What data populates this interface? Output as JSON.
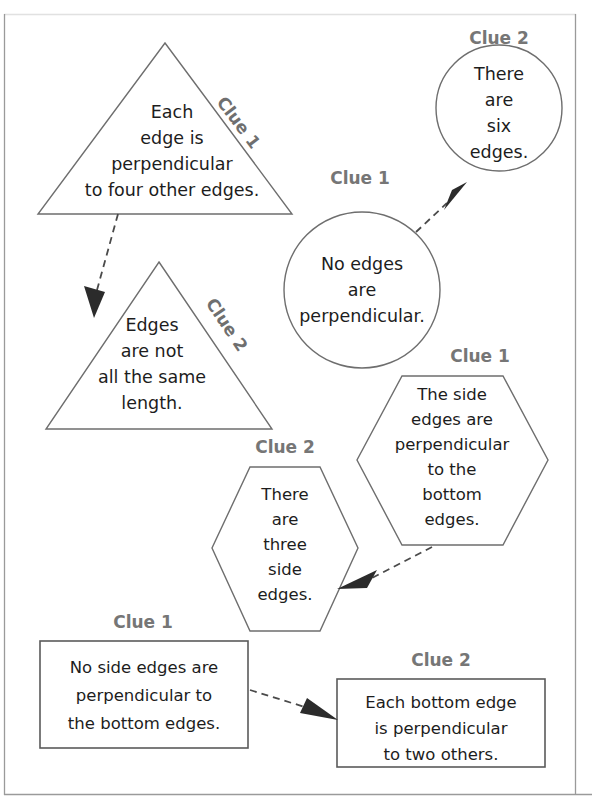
{
  "page": {
    "background_color": "#ffffff",
    "frame_color": "#9a9a9a",
    "outline_color": "#6e6e6e",
    "text_color": "#1d1d1d",
    "clue_label_color": "#767676",
    "arrow_color": "#2b2b2b"
  },
  "clue_groups": [
    {
      "id": "triangle-pair",
      "shape": "triangle",
      "nodes": [
        {
          "id": "triangle-1",
          "clue_label": "Clue 1",
          "clue_label_orientation": "rotated",
          "lines": [
            "Each",
            "edge is",
            "perpendicular",
            "to four other edges."
          ]
        },
        {
          "id": "triangle-2",
          "clue_label": "Clue 2",
          "clue_label_orientation": "rotated",
          "lines": [
            "Edges",
            "are not",
            "all the same",
            "length."
          ]
        }
      ]
    },
    {
      "id": "circle-pair",
      "shape": "circle",
      "nodes": [
        {
          "id": "circle-1",
          "clue_label": "Clue 1",
          "clue_label_orientation": "horizontal",
          "lines": [
            "No edges",
            "are",
            "perpendicular."
          ]
        },
        {
          "id": "circle-2",
          "clue_label": "Clue 2",
          "clue_label_orientation": "horizontal",
          "lines": [
            "There",
            "are",
            "six",
            "edges."
          ]
        }
      ]
    },
    {
      "id": "hexagon-pair",
      "shape": "hexagon",
      "nodes": [
        {
          "id": "hexagon-1",
          "clue_label": "Clue 1",
          "clue_label_orientation": "horizontal",
          "lines": [
            "The side",
            "edges are",
            "perpendicular",
            "to the",
            "bottom",
            "edges."
          ]
        },
        {
          "id": "hexagon-2",
          "clue_label": "Clue 2",
          "clue_label_orientation": "horizontal",
          "lines": [
            "There",
            "are",
            "three",
            "side",
            "edges."
          ]
        }
      ]
    },
    {
      "id": "rectangle-pair",
      "shape": "rectangle",
      "nodes": [
        {
          "id": "rectangle-1",
          "clue_label": "Clue 1",
          "clue_label_orientation": "horizontal",
          "lines": [
            "No side edges are",
            "perpendicular to",
            "the bottom edges."
          ]
        },
        {
          "id": "rectangle-2",
          "clue_label": "Clue 2",
          "clue_label_orientation": "horizontal",
          "lines": [
            "Each bottom edge",
            "is perpendicular",
            "to two others."
          ]
        }
      ]
    }
  ],
  "connectors": [
    {
      "id": "arrow-triangle-1-to-2",
      "from": "triangle-1",
      "to": "triangle-2",
      "style": "dashed",
      "direction": "down-left"
    },
    {
      "id": "arrow-circle-1-to-2",
      "from": "circle-1",
      "to": "circle-2",
      "style": "dashed",
      "direction": "up-right"
    },
    {
      "id": "arrow-hexagon-1-to-2",
      "from": "hexagon-1",
      "to": "hexagon-2",
      "style": "dashed",
      "direction": "down-left"
    },
    {
      "id": "arrow-rectangle-1-to-2",
      "from": "rectangle-1",
      "to": "rectangle-2",
      "style": "dashed",
      "direction": "right"
    }
  ]
}
